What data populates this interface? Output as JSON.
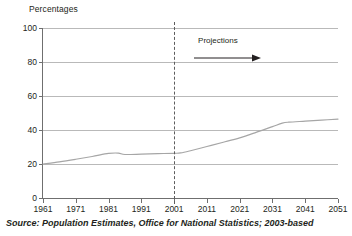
{
  "chart_data": {
    "type": "line",
    "title": "",
    "xlabel": "",
    "ylabel": "Percentages",
    "ylim": [
      0,
      100
    ],
    "xlim": [
      1961,
      2051
    ],
    "yticks": [
      0,
      20,
      40,
      60,
      80,
      100
    ],
    "xticks": [
      1961,
      1971,
      1981,
      1991,
      2001,
      2011,
      2021,
      2031,
      2041,
      2051
    ],
    "grid": "horizontal",
    "legend": "none",
    "series": [
      {
        "name": "Percentage",
        "color": "#a6a6a6",
        "x": [
          1961,
          1966,
          1971,
          1976,
          1981,
          1984,
          1986,
          1991,
          1996,
          2001,
          2003,
          2006,
          2011,
          2016,
          2021,
          2026,
          2031,
          2034,
          2036,
          2041,
          2046,
          2051
        ],
        "values": [
          20.0,
          21.3,
          22.8,
          24.4,
          26.2,
          26.4,
          25.6,
          25.8,
          26.1,
          26.3,
          26.5,
          27.8,
          30.3,
          32.8,
          35.4,
          38.6,
          42.0,
          44.0,
          44.6,
          45.2,
          45.8,
          46.4
        ]
      }
    ],
    "annotations": [
      {
        "name": "projection-divider",
        "type": "vertical-dashed-line",
        "x": 2001,
        "color": "#5d5d5d"
      },
      {
        "name": "projections-label",
        "type": "text-with-arrow",
        "text": "Projections",
        "arrow_direction": "right"
      }
    ]
  },
  "source": {
    "text": "Source: Population Estimates, Office for National Statistics; 2003-based"
  },
  "colors": {
    "series_line": "#a6a6a6",
    "gridline": "#b9b9b9",
    "axis": "#6f6f6f",
    "text": "#231f20",
    "divider": "#5d5d5d",
    "background": "#ffffff"
  }
}
